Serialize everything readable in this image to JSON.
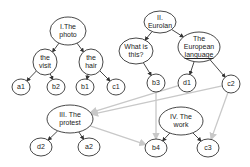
{
  "diagram": {
    "nodes": [
      {
        "id": "I",
        "label_lines": [
          "I.The",
          "photo"
        ],
        "cx": 68,
        "cy": 31,
        "rx": 18,
        "ry": 14
      },
      {
        "id": "the_visit",
        "label_lines": [
          "the",
          "visit"
        ],
        "cx": 45,
        "cy": 62,
        "rx": 12,
        "ry": 13
      },
      {
        "id": "the_hair",
        "label_lines": [
          "the",
          "hair"
        ],
        "cx": 91,
        "cy": 62,
        "rx": 12,
        "ry": 13
      },
      {
        "id": "a1",
        "label_lines": [
          "a1"
        ],
        "cx": 21,
        "cy": 87,
        "rx": 9,
        "ry": 8
      },
      {
        "id": "b2",
        "label_lines": [
          "b2"
        ],
        "cx": 56,
        "cy": 87,
        "rx": 9,
        "ry": 8
      },
      {
        "id": "b1",
        "label_lines": [
          "b1"
        ],
        "cx": 85,
        "cy": 87,
        "rx": 9,
        "ry": 8
      },
      {
        "id": "c1",
        "label_lines": [
          "c1"
        ],
        "cx": 116,
        "cy": 87,
        "rx": 9,
        "ry": 8
      },
      {
        "id": "II",
        "label_lines": [
          "II.",
          "Eurolan"
        ],
        "cx": 160,
        "cy": 22,
        "rx": 16,
        "ry": 11
      },
      {
        "id": "what_is_this",
        "label_lines": [
          "What is",
          "this?"
        ],
        "cx": 136,
        "cy": 51,
        "rx": 17,
        "ry": 13
      },
      {
        "id": "european_language",
        "label_lines": [
          "The",
          "European",
          "language"
        ],
        "cx": 199,
        "cy": 47,
        "rx": 21,
        "ry": 15,
        "underline_last": true
      },
      {
        "id": "b3",
        "label_lines": [
          "b3"
        ],
        "cx": 156,
        "cy": 83,
        "rx": 9,
        "ry": 9
      },
      {
        "id": "d1",
        "label_lines": [
          "d1"
        ],
        "cx": 187,
        "cy": 83,
        "rx": 9,
        "ry": 9
      },
      {
        "id": "c2",
        "label_lines": [
          "c2"
        ],
        "cx": 231,
        "cy": 84,
        "rx": 9,
        "ry": 9
      },
      {
        "id": "III",
        "label_lines": [
          "III. The",
          "protest"
        ],
        "cx": 70,
        "cy": 119,
        "rx": 23,
        "ry": 14
      },
      {
        "id": "IV",
        "label_lines": [
          "IV. The",
          "work"
        ],
        "cx": 181,
        "cy": 121,
        "rx": 22,
        "ry": 14
      },
      {
        "id": "d2",
        "label_lines": [
          "d2"
        ],
        "cx": 41,
        "cy": 147,
        "rx": 11,
        "ry": 9
      },
      {
        "id": "a2",
        "label_lines": [
          "a2"
        ],
        "cx": 89,
        "cy": 147,
        "rx": 11,
        "ry": 9
      },
      {
        "id": "b4",
        "label_lines": [
          "b4"
        ],
        "cx": 156,
        "cy": 148,
        "rx": 11,
        "ry": 9
      },
      {
        "id": "c3",
        "label_lines": [
          "c3"
        ],
        "cx": 208,
        "cy": 148,
        "rx": 11,
        "ry": 9
      }
    ],
    "edges_dark": [
      [
        "I",
        "the_visit"
      ],
      [
        "I",
        "the_hair"
      ],
      [
        "the_visit",
        "a1"
      ],
      [
        "the_visit",
        "b2"
      ],
      [
        "the_hair",
        "b1"
      ],
      [
        "the_hair",
        "c1"
      ],
      [
        "II",
        "what_is_this"
      ],
      [
        "II",
        "european_language"
      ],
      [
        "what_is_this",
        "b3"
      ],
      [
        "european_language",
        "d1"
      ],
      [
        "european_language",
        "c2"
      ],
      [
        "III",
        "d2"
      ],
      [
        "III",
        "a2"
      ],
      [
        "IV",
        "b4"
      ],
      [
        "IV",
        "c3"
      ]
    ],
    "edges_gray": [
      [
        "d1",
        "III"
      ],
      [
        "c2",
        "III"
      ],
      [
        "b3",
        "b4"
      ],
      [
        "III",
        "b4"
      ],
      [
        "c2",
        "c3"
      ]
    ],
    "colors": {
      "dark_edge": "#333333",
      "gray_edge": "#c8c8c8",
      "node_stroke": "#333333"
    }
  }
}
